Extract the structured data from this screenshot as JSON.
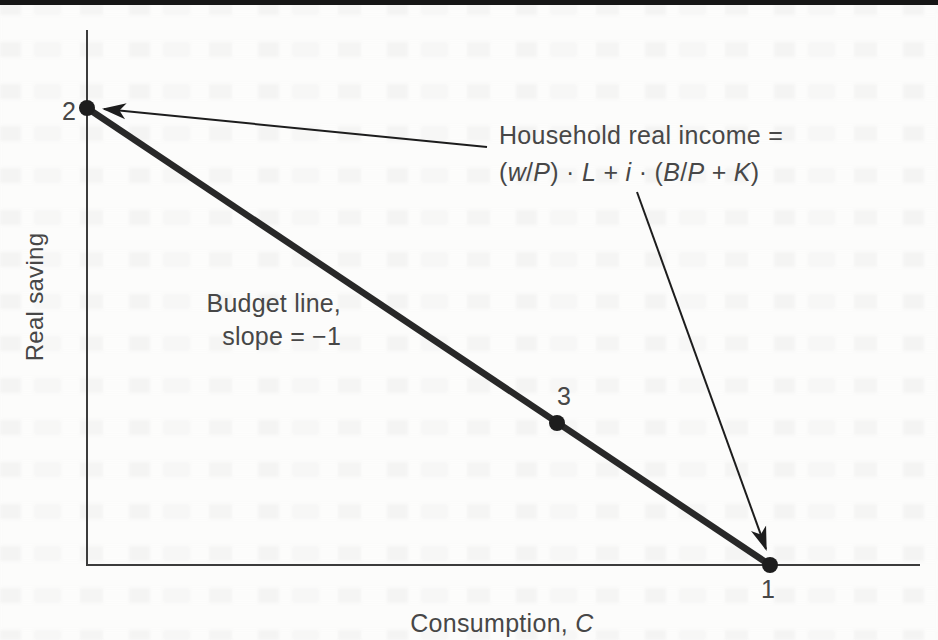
{
  "chart_data": {
    "type": "line",
    "title": "",
    "xlabel": "Consumption, C",
    "ylabel": "Real saving",
    "axis_ticks": "none (qualitative diagram, no numeric scale shown)",
    "grid": false,
    "series": [
      {
        "name": "Budget line",
        "slope": -1,
        "description": "Straight budget line from vertical intercept (point 2) to horizontal intercept (point 1), both intercepts equal to household real income",
        "points": [
          {
            "label": "2",
            "x": 0.0,
            "y": 1.0,
            "note": "all income saved (on Real saving axis)"
          },
          {
            "label": "3",
            "x": 0.69,
            "y": 0.31,
            "note": "interior point on budget line"
          },
          {
            "label": "1",
            "x": 1.0,
            "y": 0.0,
            "note": "all income consumed (on Consumption axis)"
          }
        ]
      }
    ],
    "annotations": [
      {
        "text": "Budget line, slope = −1",
        "position": "left-center of plot area"
      },
      {
        "text": "Household real income = (w/P) · L + i · (B/P + K)",
        "position": "upper right; arrows point to point 2 and point 1"
      }
    ],
    "legend": "none"
  },
  "labels": {
    "y_axis": "Real saving",
    "x_axis_text": "Consumption, ",
    "x_axis_var": "C",
    "point_2": "2",
    "point_3": "3",
    "point_1": "1",
    "budget_line_line1": "Budget line,",
    "budget_line_line2": "slope = −1",
    "income_line1": "Household real income =",
    "income_formula": "(w/P) · L + i · (B/P + K)",
    "formula_tokens": [
      {
        "t": "(",
        "i": false
      },
      {
        "t": "w",
        "i": true
      },
      {
        "t": "/",
        "i": false
      },
      {
        "t": "P",
        "i": true
      },
      {
        "t": ") · ",
        "i": false
      },
      {
        "t": "L",
        "i": true
      },
      {
        "t": " + ",
        "i": false
      },
      {
        "t": "i",
        "i": true
      },
      {
        "t": " · (",
        "i": false
      },
      {
        "t": "B",
        "i": true
      },
      {
        "t": "/",
        "i": false
      },
      {
        "t": "P",
        "i": true
      },
      {
        "t": " + ",
        "i": false
      },
      {
        "t": "K",
        "i": true
      },
      {
        "t": ")",
        "i": false
      }
    ]
  },
  "colors": {
    "background": "#fcfcfb",
    "top_rule": "#161616",
    "axis": "#3c3c3c",
    "budget_line": "#282828",
    "dot": "#1d1d1d",
    "arrow": "#1d1d1d",
    "text": "#474747"
  },
  "geometry": {
    "canvas": {
      "w": 938,
      "h": 640
    },
    "y_axis": {
      "x": 87,
      "y_top": 30,
      "y_bottom": 566,
      "width": 2
    },
    "x_axis": {
      "y": 565,
      "x_left": 87,
      "x_right": 920,
      "width": 2
    },
    "budget_line": {
      "x1": 87,
      "y1": 108,
      "x2": 770,
      "y2": 565,
      "width": 6.5
    },
    "dots": {
      "r": 8,
      "centers": [
        [
          87,
          108
        ],
        [
          557,
          423
        ],
        [
          770,
          565
        ]
      ]
    },
    "arrows": {
      "width": 2,
      "lines": [
        [
          487,
          147,
          104,
          109
        ],
        [
          637,
          192,
          766,
          549
        ]
      ]
    }
  }
}
